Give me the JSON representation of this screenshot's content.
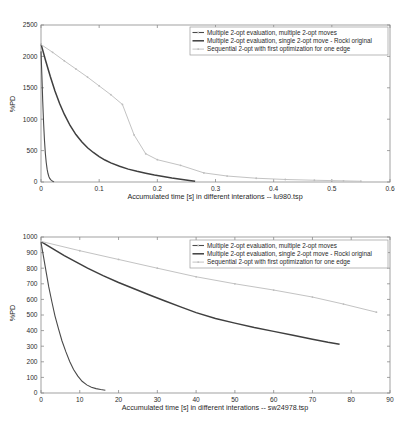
{
  "figure_top": {
    "ylabel": "%PD",
    "xlabel": "Accumulated time [s] in different interations -- lu980.tsp",
    "xticks": [
      "0",
      "0.1",
      "0.2",
      "0.3",
      "0.4",
      "0.5",
      "0.6"
    ],
    "yticks": [
      "0",
      "500",
      "1000",
      "1500",
      "2000",
      "2500"
    ],
    "legend": [
      "Multiple 2-opt evaluation, multiple 2-opt moves",
      "Multiple 2-opt evaluation, single 2-opt move - Rocki original",
      "Sequential 2-opt with first optimization for one edge"
    ]
  },
  "figure_bottom": {
    "ylabel": "%PD",
    "xlabel": "Accumulated time [s] in different interations -- sw24978.tsp",
    "xticks": [
      "0",
      "10",
      "20",
      "30",
      "40",
      "50",
      "60",
      "70",
      "80",
      "90"
    ],
    "yticks": [
      "0",
      "100",
      "200",
      "300",
      "400",
      "500",
      "600",
      "700",
      "800",
      "900",
      "1000"
    ],
    "legend": [
      "Multiple 2-opt evaluation, multiple 2-opt moves",
      "Multiple 2-opt evaluation, single 2-opt move - Rocki original",
      "Sequential 2-opt with first optimization for one edge"
    ]
  },
  "chart_data": [
    {
      "type": "line",
      "title": "",
      "xlabel": "Accumulated time [s] in different interations -- lu980.tsp",
      "ylabel": "%PD",
      "xlim": [
        0,
        0.6
      ],
      "ylim": [
        0,
        2500
      ],
      "xticks": [
        0,
        0.1,
        0.2,
        0.3,
        0.4,
        0.5,
        0.6
      ],
      "yticks": [
        0,
        500,
        1000,
        1500,
        2000,
        2500
      ],
      "grid": false,
      "legend_position": "upper-right",
      "series": [
        {
          "name": "Multiple 2-opt evaluation, multiple 2-opt moves",
          "color": "#4a4a4a",
          "style": "solid-thin",
          "x": [
            0.0,
            0.0015,
            0.003,
            0.0045,
            0.006,
            0.0075,
            0.009,
            0.0105,
            0.012,
            0.0135,
            0.015,
            0.0165,
            0.018,
            0.0195,
            0.021,
            0.0225
          ],
          "y": [
            2080,
            1700,
            1280,
            930,
            660,
            455,
            310,
            205,
            135,
            88,
            58,
            38,
            25,
            16,
            9,
            4
          ]
        },
        {
          "name": "Multiple 2-opt evaluation, single 2-opt move - Rocki original",
          "color": "#3f3f3f",
          "style": "solid-thick",
          "x": [
            0.0,
            0.008,
            0.016,
            0.024,
            0.032,
            0.04,
            0.05,
            0.06,
            0.07,
            0.08,
            0.09,
            0.1,
            0.11,
            0.12,
            0.135,
            0.15,
            0.165,
            0.18,
            0.195,
            0.21,
            0.225,
            0.24,
            0.255,
            0.265
          ],
          "y": [
            2200,
            1930,
            1680,
            1450,
            1250,
            1080,
            900,
            755,
            640,
            545,
            470,
            405,
            350,
            305,
            250,
            205,
            170,
            140,
            112,
            88,
            65,
            45,
            25,
            12
          ]
        },
        {
          "name": "Sequential 2-opt with first optimization for one edge",
          "color": "#c3c3c3",
          "style": "dotted-marker",
          "x": [
            0.0,
            0.02,
            0.04,
            0.06,
            0.08,
            0.1,
            0.12,
            0.14,
            0.16,
            0.18,
            0.2,
            0.24,
            0.28,
            0.32,
            0.37,
            0.42,
            0.47,
            0.52,
            0.55
          ],
          "y": [
            2190,
            2065,
            1930,
            1800,
            1670,
            1530,
            1390,
            1235,
            750,
            450,
            355,
            265,
            145,
            95,
            60,
            40,
            28,
            18,
            12
          ]
        }
      ]
    },
    {
      "type": "line",
      "title": "",
      "xlabel": "Accumulated time [s] in different interations -- sw24978.tsp",
      "ylabel": "%PD",
      "xlim": [
        0,
        90
      ],
      "ylim": [
        0,
        1000
      ],
      "xticks": [
        0,
        10,
        20,
        30,
        40,
        50,
        60,
        70,
        80,
        90
      ],
      "yticks": [
        0,
        100,
        200,
        300,
        400,
        500,
        600,
        700,
        800,
        900,
        1000
      ],
      "grid": false,
      "legend_position": "upper-right",
      "series": [
        {
          "name": "Multiple 2-opt evaluation, multiple 2-opt moves",
          "color": "#4a4a4a",
          "style": "solid-thin",
          "x": [
            0.0,
            0.6,
            1.3,
            2.0,
            2.8,
            3.6,
            4.5,
            5.4,
            6.4,
            7.4,
            8.4,
            9.5,
            10.6,
            11.8,
            13.0,
            14.2,
            15.4,
            16.6
          ],
          "y": [
            965,
            880,
            780,
            680,
            585,
            495,
            412,
            335,
            265,
            202,
            150,
            108,
            75,
            52,
            37,
            28,
            22,
            18
          ]
        },
        {
          "name": "Multiple 2-opt evaluation, single 2-opt move - Rocki original",
          "color": "#3f3f3f",
          "style": "solid-thick",
          "x": [
            0.0,
            3.0,
            6.0,
            9.0,
            12.0,
            16.0,
            20.0,
            24.0,
            28.0,
            32.0,
            36.0,
            40.0,
            45.0,
            50.0,
            55.0,
            60.0,
            65.0,
            70.0,
            74.0,
            77.0
          ],
          "y": [
            970,
            925,
            880,
            840,
            800,
            752,
            708,
            668,
            628,
            590,
            552,
            515,
            478,
            448,
            420,
            395,
            370,
            345,
            325,
            312
          ]
        },
        {
          "name": "Sequential 2-opt with first optimization for one edge",
          "color": "#c3c3c3",
          "style": "dotted-marker",
          "x": [
            0.0,
            10.0,
            20.0,
            30.0,
            40.0,
            50.0,
            60.0,
            70.0,
            78.0,
            86.5
          ],
          "y": [
            972,
            912,
            856,
            800,
            745,
            700,
            660,
            615,
            570,
            518
          ]
        }
      ]
    }
  ]
}
